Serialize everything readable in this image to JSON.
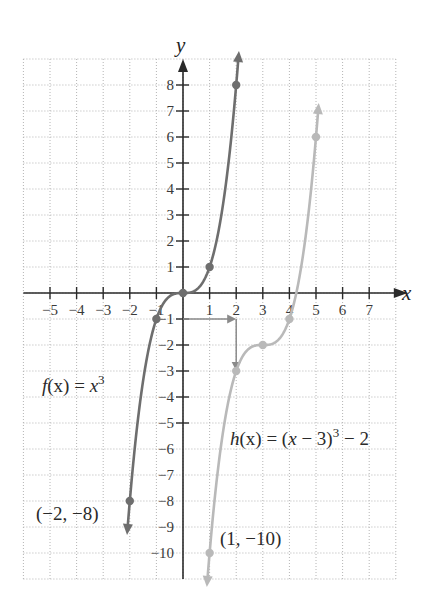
{
  "chart_data": {
    "type": "line",
    "title": "",
    "xlabel": "x",
    "ylabel": "y",
    "xlim": [
      -6,
      8
    ],
    "ylim": [
      -11,
      9
    ],
    "grid": true,
    "x_ticks": [
      -5,
      -4,
      -3,
      -2,
      -1,
      1,
      2,
      3,
      4,
      5,
      6,
      7
    ],
    "y_ticks": [
      8,
      7,
      6,
      5,
      4,
      3,
      2,
      1,
      -1,
      -2,
      -3,
      -4,
      -5,
      -6,
      -7,
      -8,
      -9,
      -10
    ],
    "x_tick_labels": [
      "−5",
      "−4",
      "−3",
      "−2",
      "−1",
      "1",
      "2",
      "3",
      "4",
      "5",
      "6",
      "7"
    ],
    "y_tick_labels": [
      "8",
      "7",
      "6",
      "5",
      "4",
      "3",
      "2",
      "1",
      "−1",
      "−2",
      "−3",
      "−4",
      "−5",
      "−6",
      "−7",
      "−8",
      "−9",
      "−10"
    ],
    "series": [
      {
        "name": "f(x) = x^3",
        "color": "#6e6e6e",
        "domain": [
          -2.08,
          2.08
        ],
        "marked_points": [
          [
            -2,
            -8
          ],
          [
            -1,
            -1
          ],
          [
            0,
            0
          ],
          [
            1,
            1
          ],
          [
            2,
            8
          ]
        ]
      },
      {
        "name": "h(x) = (x − 3)^3 − 2",
        "color": "#b9b9b9",
        "domain": [
          0.92,
          5.08
        ],
        "marked_points": [
          [
            1,
            -10
          ],
          [
            2,
            -3
          ],
          [
            3,
            -2
          ],
          [
            4,
            -1
          ],
          [
            5,
            6
          ]
        ]
      }
    ],
    "annotations": [
      {
        "text": "(−2, −8)",
        "x": -2,
        "y": -8
      },
      {
        "text": "(1, −10)",
        "x": 1,
        "y": -10
      }
    ],
    "shift_arrows": [
      {
        "from": [
          0,
          -1
        ],
        "to": [
          2,
          -1
        ],
        "meaning": "shift right 2"
      },
      {
        "from": [
          2,
          -1
        ],
        "to": [
          2,
          -3
        ],
        "meaning": "shift down 2"
      }
    ],
    "legend": "inline labels"
  },
  "labels": {
    "x_axis": "x",
    "y_axis": "y",
    "f_label_prefix": "f",
    "f_label_arg": "(x) = ",
    "f_label_var": "x",
    "f_label_exp": "3",
    "h_label_prefix": "h",
    "h_label_arg": "(x) = (",
    "h_label_var": "x",
    "h_label_mid": " − 3)",
    "h_label_exp": "3",
    "h_label_tail": " − 2",
    "point_f": "(−2, −8)",
    "point_h": "(1, −10)"
  },
  "colors": {
    "f": "#6e6e6e",
    "h": "#b9b9b9",
    "shift_arrow": "#8a8a8a",
    "axis": "#2a2a2a",
    "grid": "#b4b4b4"
  }
}
